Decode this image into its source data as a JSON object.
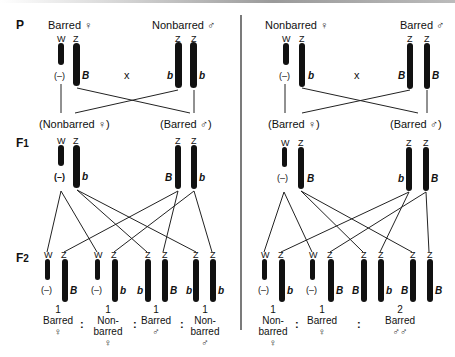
{
  "generations": {
    "p": "P",
    "f1": "F",
    "f1_sub": "1",
    "f2": "F",
    "f2_sub": "2"
  },
  "symbols": {
    "female": "♀",
    "male": "♂",
    "cross": "x",
    "colon": ":",
    "null_allele": "(–)"
  },
  "left_cross": {
    "p_female": {
      "label": "Barred ♀",
      "chromosomes": [
        "W",
        "Z"
      ],
      "alleles": [
        "(–)",
        "B"
      ]
    },
    "p_male": {
      "label": "Nonbarred ♂",
      "chromosomes": [
        "Z",
        "Z"
      ],
      "alleles": [
        "b",
        "b"
      ]
    },
    "f1_female": {
      "label": "(Nonbarred ♀)",
      "chromosomes": [
        "W",
        "Z"
      ],
      "alleles": [
        "(–)",
        "b"
      ]
    },
    "f1_male": {
      "label": "(Barred ♂)",
      "chromosomes": [
        "Z",
        "Z"
      ],
      "alleles": [
        "B",
        "b"
      ]
    },
    "f2": [
      {
        "chromosomes": [
          "W",
          "Z"
        ],
        "alleles": [
          "(–)",
          "B"
        ],
        "count": "1",
        "phenotype_lines": [
          "Barred",
          "♀"
        ]
      },
      {
        "chromosomes": [
          "W",
          "Z"
        ],
        "alleles": [
          "(–)",
          "b"
        ],
        "count": "1",
        "phenotype_lines": [
          "Non-",
          "barred",
          "♀"
        ]
      },
      {
        "chromosomes": [
          "Z",
          "Z"
        ],
        "alleles": [
          "b",
          "B"
        ],
        "count": "1",
        "phenotype_lines": [
          "Barred",
          "♂"
        ]
      },
      {
        "chromosomes": [
          "Z",
          "Z"
        ],
        "alleles": [
          "b",
          "b"
        ],
        "count": "1",
        "phenotype_lines": [
          "Non-",
          "barred",
          "♂"
        ]
      }
    ]
  },
  "right_cross": {
    "p_female": {
      "label": "Nonbarred ♀",
      "chromosomes": [
        "W",
        "Z"
      ],
      "alleles": [
        "(–)",
        "b"
      ]
    },
    "p_male": {
      "label": "Barred ♂",
      "chromosomes": [
        "Z",
        "Z"
      ],
      "alleles": [
        "B",
        "B"
      ]
    },
    "f1_female": {
      "label": "(Barred ♀)",
      "chromosomes": [
        "W",
        "Z"
      ],
      "alleles": [
        "(–)",
        "B"
      ]
    },
    "f1_male": {
      "label": "(Barred ♂)",
      "chromosomes": [
        "Z",
        "Z"
      ],
      "alleles": [
        "b",
        "B"
      ]
    },
    "f2": [
      {
        "chromosomes": [
          "W",
          "Z"
        ],
        "alleles": [
          "(–)",
          "b"
        ],
        "count": "1",
        "phenotype_lines": [
          "Non-",
          "barred",
          "♀"
        ]
      },
      {
        "chromosomes": [
          "W",
          "Z"
        ],
        "alleles": [
          "(–)",
          "B"
        ],
        "count": "1",
        "phenotype_lines": [
          "Barred",
          "♀"
        ]
      },
      {
        "chromosomes": [
          "Z",
          "Z"
        ],
        "alleles": [
          "B",
          "b"
        ],
        "count": "",
        "phenotype_lines": []
      },
      {
        "chromosomes": [
          "Z",
          "Z"
        ],
        "alleles": [
          "B",
          "B"
        ],
        "count": "2",
        "phenotype_lines": [
          "Barred",
          "♂♂"
        ]
      }
    ]
  },
  "colors": {
    "chromosome": "#111111",
    "line": "#222222",
    "background": "#ffffff"
  }
}
